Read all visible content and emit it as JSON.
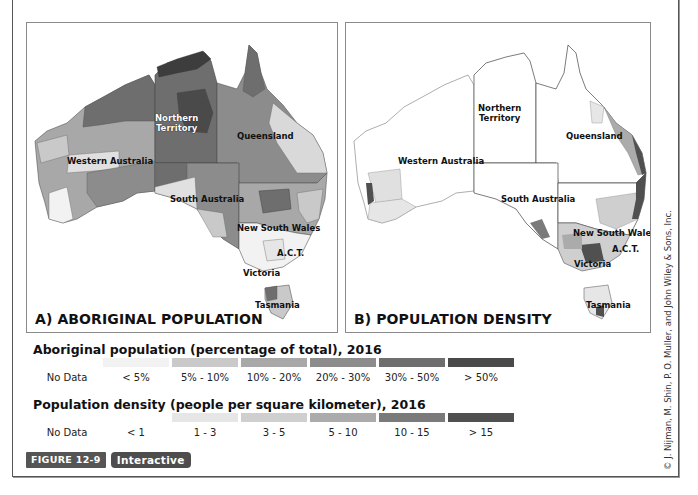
{
  "figure": {
    "label": "FIGURE 12-9",
    "interactive_button": "Interactive",
    "copyright": "© J. Nijman, M. Shin, P. O. Muller, and John Wiley & Sons, Inc."
  },
  "maps": {
    "a": {
      "title": "A) ABORIGINAL POPULATION",
      "labels": {
        "nt": "Northern Territory",
        "nt_line1": "Northern",
        "nt_line2": "Territory",
        "qld": "Queensland",
        "wa": "Western Australia",
        "sa": "South Australia",
        "nsw": "New South Wales",
        "act": "A.C.T.",
        "vic": "Victoria",
        "tas": "Tasmania"
      }
    },
    "b": {
      "title": "B) POPULATION DENSITY",
      "labels": {
        "nt_line1": "Northern",
        "nt_line2": "Territory",
        "qld": "Queensland",
        "wa": "Western Australia",
        "sa": "South Australia",
        "nsw": "New South Wales",
        "act": "A.C.T.",
        "vic": "Victoria",
        "tas": "Tasmania"
      }
    }
  },
  "legends": {
    "aboriginal": {
      "title": "Aboriginal population (percentage of total), 2016",
      "classes": [
        {
          "label": "No Data",
          "color": "#ffffff"
        },
        {
          "label": "< 5%",
          "color": "#f2f2f2"
        },
        {
          "label": "5% - 10%",
          "color": "#c9c9c9"
        },
        {
          "label": "10% - 20%",
          "color": "#a8a8a8"
        },
        {
          "label": "20% - 30%",
          "color": "#8c8c8c"
        },
        {
          "label": "30% - 50%",
          "color": "#6e6e6e"
        },
        {
          "label": "> 50%",
          "color": "#4a4a4a"
        }
      ]
    },
    "density": {
      "title": "Population density (people per square kilometer), 2016",
      "classes": [
        {
          "label": "No Data",
          "color": "#ffffff"
        },
        {
          "label": "< 1",
          "color": "#ffffff"
        },
        {
          "label": "1 - 3",
          "color": "#e6e6e6"
        },
        {
          "label": "3 - 5",
          "color": "#cfcfcf"
        },
        {
          "label": "5 - 10",
          "color": "#ababab"
        },
        {
          "label": "10 - 15",
          "color": "#7a7a7a"
        },
        {
          "label": "> 15",
          "color": "#505050"
        }
      ]
    }
  }
}
